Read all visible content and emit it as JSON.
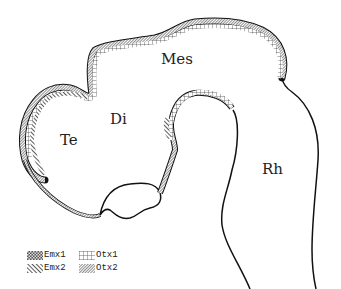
{
  "diagram": {
    "type": "anatomical schematic (embryonic brain, sagittal view)",
    "regions": [
      {
        "id": "mes",
        "label": "Mes",
        "x": 161,
        "y": 52
      },
      {
        "id": "di",
        "label": "Di",
        "x": 110,
        "y": 112
      },
      {
        "id": "te",
        "label": "Te",
        "x": 60,
        "y": 133
      },
      {
        "id": "rh",
        "label": "Rh",
        "x": 262,
        "y": 162
      }
    ],
    "legend": [
      {
        "label": "Emx1",
        "pattern": "dense-checker"
      },
      {
        "label": "Otx1",
        "pattern": "grid"
      },
      {
        "label": "Emx2",
        "pattern": "diagonal-coarse"
      },
      {
        "label": "Otx2",
        "pattern": "diagonal-fine"
      }
    ],
    "colors": {
      "line": "#111111",
      "text": "#222222",
      "background": "#ffffff"
    }
  }
}
